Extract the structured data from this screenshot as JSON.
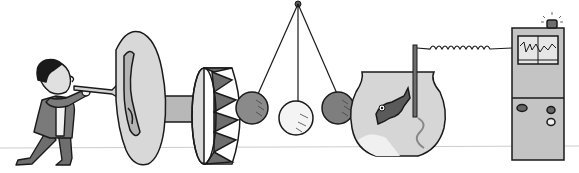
{
  "illustration": {
    "description": "Cartoon chain-reaction machine: a man blows a horn into a giant ear, which connects to a drum that strikes a Newton's-cradle style pendulum, which knocks into a fishbowl with a fish; a probe in the bowl connects via a coiled wire to a monitoring machine with a flashing light on top.",
    "elements": [
      "man-blowing-horn",
      "giant-ear",
      "drum",
      "pendulum-cradle",
      "fishbowl-with-fish",
      "probe-rod",
      "coiled-wire",
      "monitor-machine",
      "alarm-light"
    ],
    "pendulum_ball_count": 3,
    "colors": {
      "background": "#ffffff",
      "outline": "#1a1a1a",
      "light_gray": "#d4d4d4",
      "mid_gray": "#a8a8a8",
      "dark_gray": "#6e6e6e",
      "floor_line": "#c8c8c8"
    }
  }
}
